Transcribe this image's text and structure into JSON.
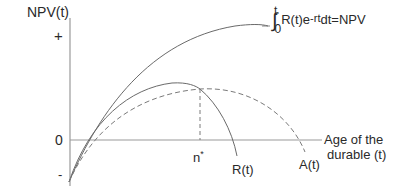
{
  "diagram": {
    "y_axis": {
      "label": "NPV(t)",
      "plus_marker": "+",
      "zero_marker": "0",
      "minus_marker": "-"
    },
    "x_axis": {
      "label_line1": "Age of the",
      "label_line2": "durable (t)",
      "marker": "n",
      "marker_superscript": "*"
    },
    "curves": {
      "npv_integral": {
        "style": "solid",
        "formula": {
          "integral_sign": "∫",
          "upper_limit": "t",
          "lower_limit": "0",
          "integrand": "R(t)e",
          "exponent": "-rt",
          "rest": "dt=NPV"
        }
      },
      "r_curve": {
        "label": "R(t)",
        "style": "solid"
      },
      "a_curve": {
        "label": "A(t)",
        "style": "dashed"
      },
      "optimum_line": {
        "style": "dashed",
        "at": "n*"
      }
    },
    "colors": {
      "axis": "#9a9a9a",
      "curve": "#6a6a6a",
      "text": "#2a2a2a"
    }
  }
}
